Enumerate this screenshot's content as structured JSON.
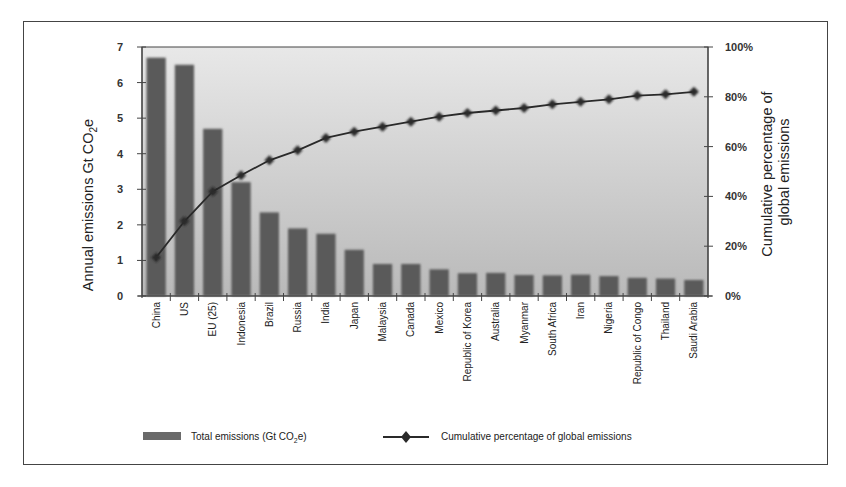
{
  "chart_data": {
    "type": "bar",
    "combo": "bar+line (pareto)",
    "categories": [
      "China",
      "US",
      "EU (25)",
      "Indonesia",
      "Brazil",
      "Russia",
      "India",
      "Japan",
      "Malaysia",
      "Canada",
      "Mexico",
      "Republic of Korea",
      "Australia",
      "Myanmar",
      "South Africa",
      "Iran",
      "Nigeria",
      "Republic of Congo",
      "Thailand",
      "Saudi Arabia"
    ],
    "series": [
      {
        "name": "Total emissions (Gt CO2e)",
        "type": "bar",
        "axis": "left",
        "color": "#5a5a5a",
        "values": [
          6.7,
          6.5,
          4.7,
          3.2,
          2.35,
          1.9,
          1.75,
          1.3,
          0.9,
          0.9,
          0.75,
          0.64,
          0.65,
          0.59,
          0.58,
          0.6,
          0.56,
          0.51,
          0.49,
          0.45
        ]
      },
      {
        "name": "Cumulative percentage of global emissions",
        "type": "line",
        "axis": "right",
        "color": "#2a2a2a",
        "marker": "diamond",
        "values": [
          15.5,
          30,
          42,
          48.5,
          54.5,
          58.5,
          63.5,
          66,
          68,
          70,
          72,
          73.5,
          74.5,
          75.5,
          77,
          78,
          79,
          80.5,
          81,
          82
        ]
      }
    ],
    "title": "",
    "xlabel": "",
    "ylabel": "Annual emissions Gt CO2e",
    "ylabel_main": "Annual emissions Gt CO",
    "ylabel_sub": "2",
    "ylabel_tail": "e",
    "y2label_line1": "Cumulative percentage of",
    "y2label_line2": "global emissions",
    "ylim": [
      0,
      7
    ],
    "y2lim": [
      0,
      100
    ],
    "yticks": [
      "0",
      "1",
      "2",
      "3",
      "4",
      "5",
      "6",
      "7"
    ],
    "y2ticks": [
      "0%",
      "20%",
      "40%",
      "60%",
      "80%",
      "100%"
    ],
    "grid": false,
    "legend_position": "bottom",
    "legend": {
      "bar_label_main": "Total emissions (Gt CO",
      "bar_label_sub": "2",
      "bar_label_tail": "e)",
      "line_label": "Cumulative percentage of global emissions"
    },
    "colors": {
      "plot_bg_top": "#e8e8e8",
      "plot_bg_bottom": "#b9b9b9",
      "bar": "#5a5a5a",
      "line": "#2a2a2a"
    }
  }
}
